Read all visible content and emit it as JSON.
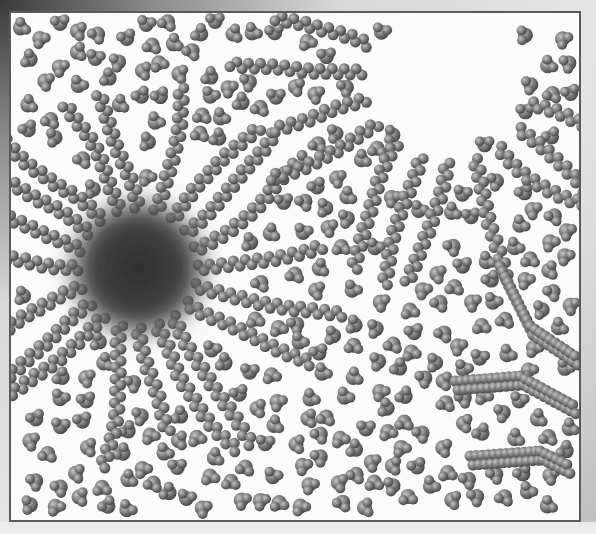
{
  "figure": {
    "frame": {
      "x": 9,
      "y": 11,
      "width": 572,
      "height": 511,
      "border_color": "#5a5a5a",
      "background": "#fbfbfb"
    },
    "micelle": {
      "cx": 138,
      "cy": 268,
      "r": 62,
      "core_color": "#3c3c3c",
      "chain_count": 20,
      "chain_length": 130
    },
    "cleared_region": {
      "cx": 450,
      "cy": 75,
      "r": 78
    },
    "chain_groups": [
      {
        "cx": 450,
        "cy": 75,
        "inner_r": 82,
        "count": 11,
        "length": 120,
        "start_angle": 20,
        "end_angle": 200
      }
    ],
    "lamellae": [
      {
        "points": [
          [
            455,
            385
          ],
          [
            520,
            380
          ],
          [
            575,
            410
          ]
        ]
      },
      {
        "points": [
          [
            470,
            460
          ],
          [
            540,
            455
          ],
          [
            570,
            470
          ]
        ]
      },
      {
        "points": [
          [
            500,
            270
          ],
          [
            530,
            330
          ],
          [
            575,
            360
          ]
        ]
      }
    ],
    "water": {
      "count": 260,
      "color": "#7a7a7a",
      "seed": 7
    },
    "molecule_shade": {
      "dark": "#4a4a4a",
      "mid": "#7d7d7d",
      "light": "#b9b9b9"
    }
  }
}
